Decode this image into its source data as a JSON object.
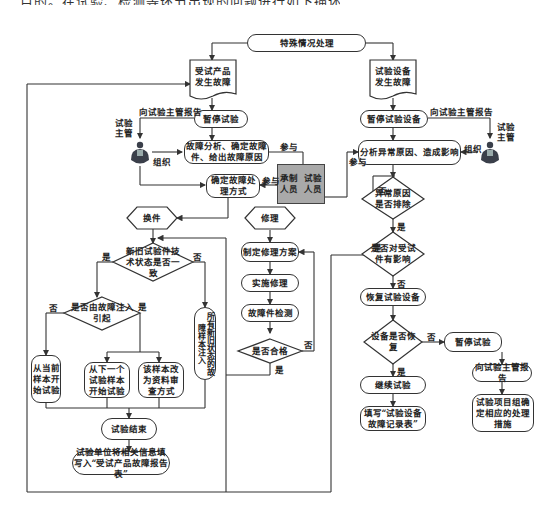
{
  "top_text_cut": "目的。在试验、检测等环节出现的问题进行如下描述。",
  "nodes": {
    "start": "特殊情况处理",
    "product_fault": "受试产品发生故障",
    "equip_fault": "试验设备发生故障",
    "pause_test": "暂停试验",
    "pause_equip": "暂停试验设备",
    "fault_analysis": "故障分析、确定故障件、给出故障原因",
    "analyze_abnormal": "分析异常原因、造成影响",
    "determine_method": "确定故障处理方式",
    "participants": "承制人员  试验人员",
    "participants_a": "承制\n人员",
    "participants_b": "试验\n人员",
    "replace": "换件",
    "repair": "修理",
    "abnormal_resolved": "异常原因是否排除",
    "affects_product": "是否对受试件有影响",
    "tech_state_same": "新旧试验件技术状态是否一致",
    "fault_injection": "是否由故障注入引起",
    "all_inject": "所有新旧状态的故障样本注入",
    "from_current": "从当前样本开始试验",
    "from_next": "从下一个试验样本开始试验",
    "to_review": "该样本改为资料审查方式",
    "repair_plan": "制定修理方案",
    "do_repair": "实施修理",
    "fault_check": "故障件检测",
    "qualified": "是否合格",
    "restore_equip": "恢复试验设备",
    "equip_restored": "设备是否恢复",
    "continue_test": "继续试验",
    "fill_equip_log": "填写“试验设备故障记录表”",
    "pause_test_2": "暂停试验",
    "report_2": "向试验主管报告",
    "team_decide": "试验项目组确定相应的处理措施",
    "test_end": "试验结束",
    "fill_report": "试验单位将相关信息填写入“受试产品故障报告表”"
  },
  "labels": {
    "report_left": "向试验主管报告",
    "report_right": "向试验主管报告",
    "supervisor_left": "试验\n主管",
    "supervisor_right": "试验\n主管",
    "organize_left": "组织",
    "organize_right": "组织",
    "participate_1": "参与",
    "participate_2": "参与",
    "participate_3": "参与",
    "yes": "是",
    "no": "否"
  },
  "colors": {
    "line": "#333333",
    "gray_box": "#a9a9a9",
    "supervisor_icon": "#3a3f4a"
  }
}
